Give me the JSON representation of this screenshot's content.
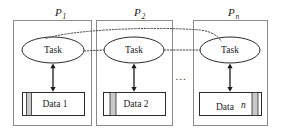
{
  "figure": {
    "background_color": "#ffffff",
    "width": 281,
    "height": 136
  },
  "style": {
    "outer_box_stroke": "#8a8a8a",
    "node_stroke": "#2b2b2b",
    "stripe_fill": "#c9c9c9",
    "arrow_color": "#1a1a1a",
    "dotted_link_color": "#4a4a4a",
    "text_color": "#1a1a1a"
  },
  "processes": [
    {
      "id": "P1",
      "label_base": "P",
      "label_sub": "1",
      "task_label": "Task",
      "data_label": "Data 1",
      "data_label_base": "Data",
      "data_label_index": "1",
      "stripe_position": "left"
    },
    {
      "id": "P2",
      "label_base": "P",
      "label_sub": "2",
      "task_label": "Task",
      "data_label": "Data 2",
      "data_label_base": "Data",
      "data_label_index": "2",
      "stripe_position": "left-inset"
    },
    {
      "id": "Pn",
      "label_base": "P",
      "label_sub": "n",
      "task_label": "Task",
      "data_label": "Data n",
      "data_label_base": "Data",
      "data_label_index": "n",
      "stripe_position": "right"
    }
  ],
  "ellipsis": {
    "label": "..."
  },
  "connections": {
    "task_to_data_label": "bidirectional data access",
    "task_to_task_label": "inter-task communication"
  }
}
